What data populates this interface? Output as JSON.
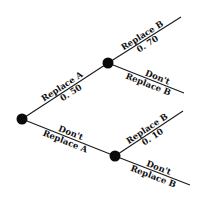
{
  "diagram": {
    "type": "decision-tree",
    "nodes": [
      {
        "id": "root",
        "x": 22,
        "y": 119
      },
      {
        "id": "replace-a",
        "x": 108,
        "y": 63
      },
      {
        "id": "dont-replace-a",
        "x": 115,
        "y": 156
      }
    ],
    "edges": [
      {
        "id": "root-replace-a",
        "from": "root",
        "to": "replace-a",
        "label_top": "Replace A",
        "label_bottom": "0. 50"
      },
      {
        "id": "root-dont-replace-a",
        "from": "root",
        "to": "dont-replace-a",
        "label_top": "Don't",
        "label_bottom": "Replace A"
      },
      {
        "id": "a-replace-b",
        "from": "replace-a",
        "to": "end-1",
        "label_top": "Replace B",
        "label_bottom": "0. 70"
      },
      {
        "id": "a-dont-replace-b",
        "from": "replace-a",
        "to": "end-2",
        "label_top": "Don't",
        "label_bottom": "Replace B"
      },
      {
        "id": "nota-replace-b",
        "from": "dont-replace-a",
        "to": "end-3",
        "label_top": "Replace B",
        "label_bottom": "0. 10"
      },
      {
        "id": "nota-dont-replace-b",
        "from": "dont-replace-a",
        "to": "end-4",
        "label_top": "Don't",
        "label_bottom": "Replace B"
      }
    ],
    "colors": {
      "line": "#1a1a1a",
      "node": "#0a0a0a",
      "background": "#ffffff"
    }
  }
}
